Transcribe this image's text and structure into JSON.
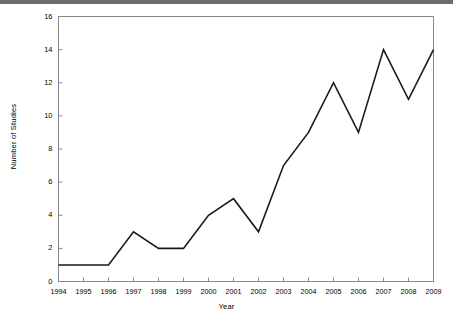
{
  "chart_data": {
    "type": "line",
    "title": "",
    "xlabel": "Year",
    "ylabel": "Number of Studies",
    "categories": [
      1994,
      1995,
      1996,
      1997,
      1998,
      1999,
      2000,
      2001,
      2002,
      2003,
      2004,
      2005,
      2006,
      2007,
      2008,
      2009
    ],
    "values": [
      1,
      1,
      1,
      3,
      2,
      2,
      4,
      5,
      3,
      7,
      9,
      12,
      9,
      14,
      11,
      14
    ],
    "series": [
      {
        "name": "Number of Studies",
        "values": [
          1,
          1,
          1,
          3,
          2,
          2,
          4,
          5,
          3,
          7,
          9,
          12,
          9,
          14,
          11,
          14
        ]
      }
    ],
    "x_tick_labels": [
      "1994",
      "1995",
      "1996",
      "1997",
      "1998",
      "1999",
      "2000",
      "2001",
      "2002",
      "2003",
      "2004",
      "2005",
      "2006",
      "2007",
      "2008",
      "2009"
    ],
    "y_tick_labels": [
      "0",
      "2",
      "4",
      "6",
      "8",
      "10",
      "12",
      "14",
      "16"
    ],
    "y_ticks": [
      0,
      2,
      4,
      6,
      8,
      10,
      12,
      14,
      16
    ],
    "ylim": [
      0,
      16
    ],
    "xlim": [
      1994,
      2009
    ],
    "grid": false,
    "legend": false,
    "line_color": "#1a1a1a",
    "frame_color": "#888888",
    "background_color": "#ffffff",
    "markers": false
  }
}
